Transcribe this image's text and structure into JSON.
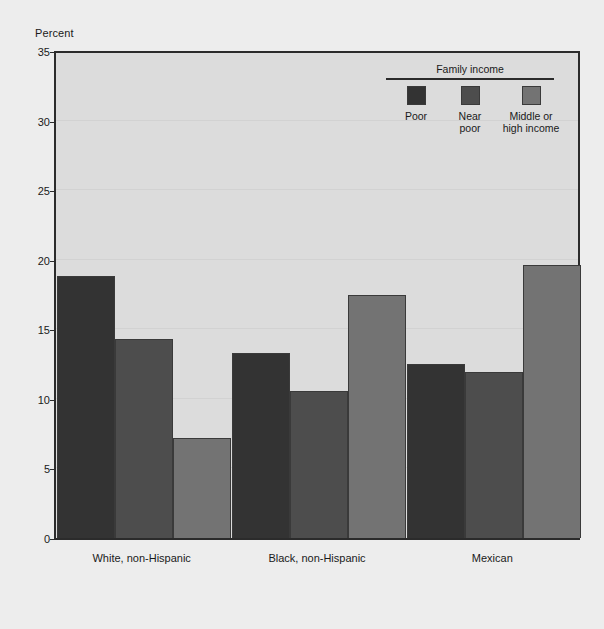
{
  "chart_data": {
    "type": "bar",
    "title": "",
    "ylabel": "Percent",
    "xlabel": "",
    "ylim": [
      0,
      35
    ],
    "yticks": [
      0,
      5,
      10,
      15,
      20,
      25,
      30,
      35
    ],
    "grid": true,
    "legend_position": "top-right",
    "legend_title": "Family income",
    "categories": [
      "White, non-Hispanic",
      "Black, non-Hispanic",
      "Mexican"
    ],
    "series": [
      {
        "name": "Poor",
        "color": "#333333",
        "values": [
          18.8,
          13.3,
          12.5
        ]
      },
      {
        "name": "Near poor",
        "color": "#4d4d4d",
        "values": [
          14.3,
          10.6,
          11.9
        ]
      },
      {
        "name": "Middle or high income",
        "color": "#737373",
        "values": [
          7.2,
          17.5,
          19.6
        ]
      }
    ]
  },
  "legend": {
    "title": "Family income",
    "items": [
      {
        "label": "Poor",
        "color": "#333333"
      },
      {
        "label": "Near\npoor",
        "color": "#4d4d4d"
      },
      {
        "label": "Middle or\nhigh income",
        "color": "#737373"
      }
    ]
  },
  "axes": {
    "y_title": "Percent",
    "y_ticks": [
      "35",
      "30",
      "25",
      "20",
      "15",
      "10",
      "5",
      "0"
    ],
    "x_labels": [
      "White, non-Hispanic",
      "Black, non-Hispanic",
      "Mexican"
    ]
  },
  "colors": {
    "page_background": "#ededed",
    "plot_background": "#dcdcdc",
    "axis": "#2b2b2b",
    "gridline": "#d2d2d2",
    "text": "#1a1a1a"
  }
}
